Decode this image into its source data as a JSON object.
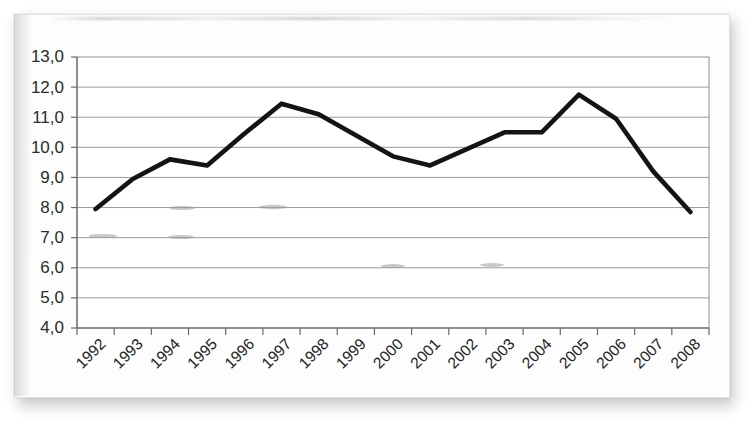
{
  "chart_data": {
    "type": "line",
    "title": "",
    "subtitle": "",
    "xlabel": "",
    "ylabel": "",
    "categories": [
      "1992",
      "1993",
      "1994",
      "1995",
      "1996",
      "1997",
      "1998",
      "1999",
      "2000",
      "2001",
      "2002",
      "2003",
      "2004",
      "2005",
      "2006",
      "2007",
      "2008"
    ],
    "series": [
      {
        "name": "",
        "values": [
          7.95,
          8.95,
          9.6,
          9.4,
          10.45,
          11.45,
          11.1,
          10.4,
          9.7,
          9.4,
          9.95,
          10.5,
          10.5,
          11.75,
          10.95,
          9.2,
          7.85
        ]
      }
    ],
    "ylim": [
      4.0,
      13.0
    ],
    "ytick_values": [
      4.0,
      5.0,
      6.0,
      7.0,
      8.0,
      9.0,
      10.0,
      11.0,
      12.0,
      13.0
    ],
    "ytick_labels": [
      "4,0",
      "5,0",
      "6,0",
      "7,0",
      "8,0",
      "9,0",
      "10,0",
      "11,0",
      "12,0",
      "13,0"
    ],
    "decimal_separator": ",",
    "grid": true,
    "grid_axis": "y",
    "legend": false,
    "legend_position": "none",
    "xtick_rotation": 45,
    "line_color": "#141414",
    "grid_color": "#8e8e8e",
    "axis_color": "#6a6a6a",
    "plot_background": "#ffffff",
    "page_background": "#fdfdfd"
  },
  "figure": {
    "media": "scanned-page",
    "border_color": "#e2e2e2"
  }
}
